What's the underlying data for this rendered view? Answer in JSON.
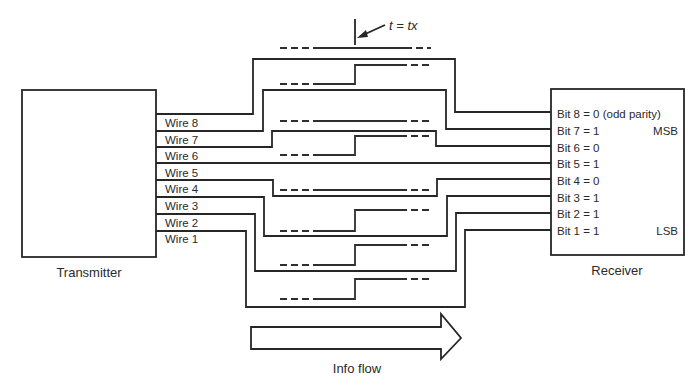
{
  "diagram": {
    "type": "parallel-transmission",
    "time_marker": {
      "label": "t = tx",
      "x": 355
    },
    "transmitter": {
      "label": "Transmitter"
    },
    "receiver": {
      "label": "Receiver"
    },
    "info_flow": {
      "label": "Info flow"
    },
    "wires": [
      {
        "label": "Wire 8",
        "bit_label": "Bit 8 = 0 (odd parity)",
        "tag": "",
        "value": 0
      },
      {
        "label": "Wire 7",
        "bit_label": "Bit 7 = 1",
        "tag": "MSB",
        "value": 1
      },
      {
        "label": "Wire 6",
        "bit_label": "Bit 6 = 0",
        "tag": "",
        "value": 0
      },
      {
        "label": "Wire 5",
        "bit_label": "Bit 5 = 1",
        "tag": "",
        "value": 1
      },
      {
        "label": "Wire 4",
        "bit_label": "Bit 4 = 0",
        "tag": "",
        "value": 0
      },
      {
        "label": "Wire 3",
        "bit_label": "Bit 3 = 1",
        "tag": "",
        "value": 1
      },
      {
        "label": "Wire 2",
        "bit_label": "Bit 2 = 1",
        "tag": "",
        "value": 1
      },
      {
        "label": "Wire 1",
        "bit_label": "Bit 1 = 1",
        "tag": "LSB",
        "value": 1
      }
    ]
  }
}
